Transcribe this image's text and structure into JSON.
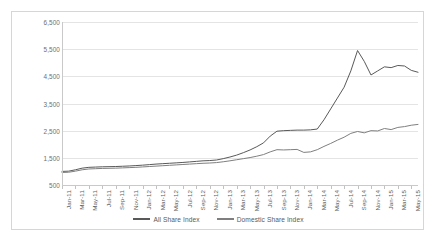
{
  "chart_data": {
    "type": "line",
    "title": "",
    "xlabel": "",
    "ylabel": "",
    "ylim": [
      500,
      6500
    ],
    "ytick_step": 1000,
    "ytick_labels": [
      "6,500",
      "5,500",
      "4,500",
      "3,500",
      "2,500",
      "1,500",
      "500"
    ],
    "ytick_values": [
      6500,
      5500,
      4500,
      3500,
      2500,
      1500,
      500
    ],
    "grid": true,
    "legend_position": "bottom",
    "x": [
      "Jan-11",
      "Feb-11",
      "Mar-11",
      "Apr-11",
      "May-11",
      "Jun-11",
      "Jul-11",
      "Aug-11",
      "Sep-11",
      "Oct-11",
      "Nov-11",
      "Dec-11",
      "Jan-12",
      "Feb-12",
      "Mar-12",
      "Apr-12",
      "May-12",
      "Jun-12",
      "Jul-12",
      "Aug-12",
      "Sep-12",
      "Oct-12",
      "Nov-12",
      "Dec-12",
      "Jan-13",
      "Feb-13",
      "Mar-13",
      "Apr-13",
      "May-13",
      "Jun-13",
      "Jul-13",
      "Aug-13",
      "Sep-13",
      "Oct-13",
      "Nov-13",
      "Dec-13",
      "Jan-14",
      "Feb-14",
      "Mar-14",
      "Apr-14",
      "May-14",
      "Jun-14",
      "Jul-14",
      "Aug-14",
      "Sep-14",
      "Oct-14",
      "Nov-14",
      "Dec-14",
      "Jan-15",
      "Feb-15",
      "Mar-15",
      "Apr-15",
      "May-15",
      "Jun-15"
    ],
    "xtick_labels": [
      "Jan-11",
      "Mar-11",
      "May-11",
      "Jul-11",
      "Sep-11",
      "Nov-11",
      "Jan-12",
      "Mar-12",
      "May-12",
      "Jul-12",
      "Sep-12",
      "Nov-12",
      "Jan-13",
      "Mar-13",
      "May-13",
      "Jul-13",
      "Sep-13",
      "Nov-13",
      "Jan-14",
      "Mar-14",
      "May-14",
      "Jul-14",
      "Sep-14",
      "Nov-14",
      "Jan-15",
      "Mar-15",
      "May-15"
    ],
    "xtick_indices": [
      0,
      2,
      4,
      6,
      8,
      10,
      12,
      14,
      16,
      18,
      20,
      22,
      24,
      26,
      28,
      30,
      32,
      34,
      36,
      38,
      40,
      42,
      44,
      46,
      48,
      50,
      52
    ],
    "series": [
      {
        "name": "All Share Index",
        "color": "#595959",
        "values": [
          1000,
          1010,
          1060,
          1120,
          1150,
          1160,
          1170,
          1175,
          1180,
          1190,
          1200,
          1215,
          1230,
          1250,
          1270,
          1285,
          1300,
          1315,
          1330,
          1350,
          1370,
          1390,
          1400,
          1420,
          1470,
          1530,
          1600,
          1690,
          1790,
          1910,
          2050,
          2300,
          2480,
          2500,
          2510,
          2520,
          2520,
          2530,
          2560,
          2900,
          3300,
          3700,
          4100,
          4700,
          5450,
          5050,
          4550,
          4700,
          4850,
          4820,
          4900,
          4880,
          4720,
          4650
        ]
      },
      {
        "name": "Domestic Share Index",
        "color": "#7f7f7f",
        "values": [
          960,
          970,
          1010,
          1060,
          1090,
          1100,
          1110,
          1115,
          1120,
          1130,
          1140,
          1150,
          1165,
          1180,
          1195,
          1210,
          1225,
          1240,
          1255,
          1270,
          1285,
          1300,
          1310,
          1325,
          1355,
          1390,
          1430,
          1470,
          1510,
          1560,
          1620,
          1720,
          1800,
          1790,
          1800,
          1810,
          1700,
          1720,
          1800,
          1920,
          2030,
          2150,
          2260,
          2400,
          2470,
          2420,
          2500,
          2490,
          2580,
          2540,
          2620,
          2650,
          2700,
          2730
        ]
      }
    ]
  },
  "legend": {
    "items": [
      {
        "label": "All Share Index",
        "color": "#595959"
      },
      {
        "label": "Domestic Share Index",
        "color": "#7f7f7f"
      }
    ]
  }
}
